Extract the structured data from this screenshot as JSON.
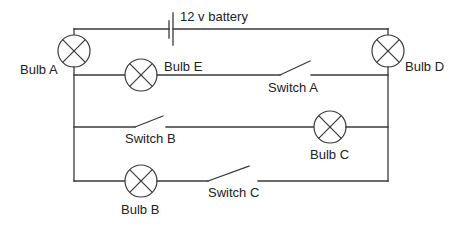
{
  "diagram": {
    "type": "circuit",
    "battery": {
      "label": "12 v battery"
    },
    "bulbs": [
      {
        "id": "A",
        "label": "Bulb A"
      },
      {
        "id": "B",
        "label": "Bulb B"
      },
      {
        "id": "C",
        "label": "Bulb C"
      },
      {
        "id": "D",
        "label": "Bulb D"
      },
      {
        "id": "E",
        "label": "Bulb E"
      }
    ],
    "switches": [
      {
        "id": "A",
        "label": "Switch A",
        "state": "open"
      },
      {
        "id": "B",
        "label": "Switch B",
        "state": "open"
      },
      {
        "id": "C",
        "label": "Switch C",
        "state": "open"
      }
    ],
    "colors": {
      "wire": "#3a3a3a",
      "text": "#222222",
      "background": "#ffffff"
    }
  }
}
